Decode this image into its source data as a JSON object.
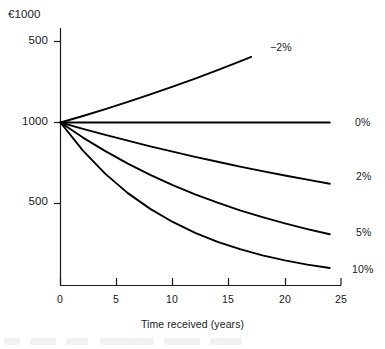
{
  "chart_data": {
    "type": "line",
    "title": "",
    "subtitle": "",
    "ylabel": "€1000",
    "xlabel": "Time received (years)",
    "xlim": [
      0,
      25
    ],
    "ylim": [
      0,
      1500
    ],
    "grid": false,
    "legend_position": "right-of-line-ends",
    "xticks": [
      "0",
      "5",
      "10",
      "15",
      "20",
      "25"
    ],
    "xtick_values": [
      0,
      5,
      10,
      15,
      20,
      25
    ],
    "yticks": [
      "500",
      "1000",
      "500"
    ],
    "ytick_values": [
      1500,
      1000,
      500
    ],
    "annotations": [
      "Lines show the value of €1000 received at a future date, discounted at rates from -2% to 10%"
    ],
    "series": [
      {
        "name": "-2%",
        "label": "−2%",
        "rate": -0.02,
        "x": [
          0,
          2,
          4,
          6,
          8,
          10,
          12,
          14,
          16,
          17
        ],
        "values": [
          1000,
          1040,
          1083,
          1127,
          1173,
          1221,
          1271,
          1323,
          1377,
          1405
        ],
        "label_x": 17,
        "label_y": 1440
      },
      {
        "name": "0%",
        "label": "0%",
        "rate": 0.0,
        "x": [
          0,
          5,
          10,
          15,
          20,
          24
        ],
        "values": [
          1000,
          1000,
          1000,
          1000,
          1000,
          1000
        ],
        "label_x": 24,
        "label_y": 1000
      },
      {
        "name": "2%",
        "label": "2%",
        "rate": 0.02,
        "x": [
          0,
          2,
          4,
          6,
          8,
          10,
          12,
          14,
          16,
          18,
          20,
          22,
          24
        ],
        "values": [
          1000,
          961,
          924,
          888,
          853,
          820,
          788,
          758,
          728,
          700,
          673,
          647,
          622
        ],
        "label_x": 24,
        "label_y": 622
      },
      {
        "name": "5%",
        "label": "5%",
        "rate": 0.05,
        "x": [
          0,
          2,
          4,
          6,
          8,
          10,
          12,
          14,
          16,
          18,
          20,
          22,
          24
        ],
        "values": [
          1000,
          907,
          823,
          746,
          677,
          614,
          557,
          505,
          458,
          416,
          377,
          342,
          310
        ],
        "label_x": 24,
        "label_y": 310
      },
      {
        "name": "10%",
        "label": "10%",
        "rate": 0.1,
        "x": [
          0,
          2,
          4,
          6,
          8,
          10,
          12,
          14,
          16,
          18,
          20,
          22,
          24
        ],
        "values": [
          1000,
          826,
          683,
          564,
          467,
          386,
          319,
          263,
          218,
          180,
          149,
          123,
          102
        ],
        "label_x": 24,
        "label_y": 102
      }
    ]
  },
  "axes": {
    "y_title": "€1000",
    "x_title": "Time received (years)",
    "ytick_labels": [
      "500",
      "1000",
      "500"
    ],
    "xtick_labels": [
      "0",
      "5",
      "10",
      "15",
      "20",
      "25"
    ]
  },
  "series_labels": {
    "neg2": "−2%",
    "zero": "0%",
    "two": "2%",
    "five": "5%",
    "ten": "10%"
  },
  "colors": {
    "line": "#000000",
    "axis": "#1a1a1a",
    "text": "#1a1a1a",
    "background": "#ffffff"
  }
}
